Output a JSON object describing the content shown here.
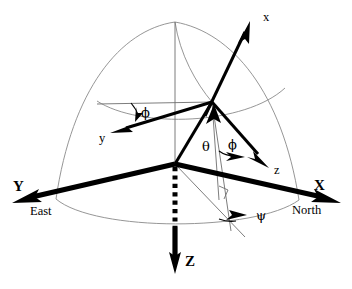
{
  "figure": {
    "type": "coordinate-frame-diagram",
    "background_color": "#ffffff",
    "ink_color": "#000000",
    "guide_color": "#8a8a8a"
  },
  "labels": {
    "body_x": "x",
    "body_y": "y",
    "body_z": "z",
    "frame_x": "X",
    "frame_y": "Y",
    "frame_z": "Z",
    "north": "North",
    "east": "East",
    "theta": "θ",
    "phi_upper": "ϕ",
    "phi_lower": "ϕ",
    "psi": "ψ"
  },
  "geometry": {
    "origin": {
      "x": 175,
      "y": 164
    },
    "apex": {
      "x": 212,
      "y": 102
    },
    "sphere_top": {
      "x": 175,
      "y": 22
    },
    "x_axis_tip": {
      "x": 338,
      "y": 203
    },
    "y_axis_tip": {
      "x": 14,
      "y": 203
    },
    "z_axis_tip": {
      "x": 175,
      "y": 272
    },
    "body_x_tip": {
      "x": 250,
      "y": 22
    },
    "body_y_tip": {
      "x": 112,
      "y": 133
    },
    "body_z_tip": {
      "x": 268,
      "y": 167
    }
  },
  "angles": {
    "theta_label_pos": {
      "x": 202,
      "y": 140
    },
    "phi_upper_label_pos": {
      "x": 141,
      "y": 107
    },
    "phi_lower_label_pos": {
      "x": 228,
      "y": 138
    },
    "psi_label_pos": {
      "x": 256,
      "y": 210
    }
  }
}
